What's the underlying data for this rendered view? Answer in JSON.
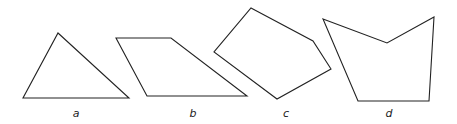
{
  "figure": {
    "stroke_color": "#222222",
    "background": "#ffffff",
    "shapes": [
      {
        "id": "a",
        "label": "a",
        "kind": "triangle",
        "points": "58,33 129,98 23,98",
        "label_pos": [
          76,
          117
        ]
      },
      {
        "id": "b",
        "label": "b",
        "kind": "parallelogram",
        "points": "116,38 171,38 247,96 147,96",
        "label_pos": [
          193,
          117
        ]
      },
      {
        "id": "c",
        "label": "c",
        "kind": "pentagon",
        "points": "251,8 313,41 331,69 277,99 214,52",
        "label_pos": [
          286,
          117
        ]
      },
      {
        "id": "d",
        "label": "d",
        "kind": "concave-pentagon",
        "points": "323,19 387,43 434,17 429,101 358,101",
        "label_pos": [
          389,
          117
        ]
      }
    ]
  }
}
